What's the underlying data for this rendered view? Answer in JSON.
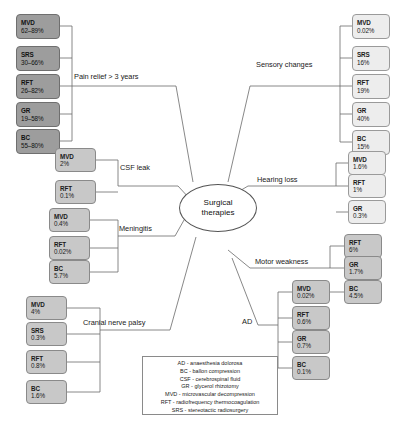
{
  "diagram": {
    "center": {
      "line1": "Surgical",
      "line2": "therapies"
    },
    "branches": [
      {
        "id": "pain-relief",
        "label": "Pain relief > 3 years",
        "side": "left",
        "shade": "dark",
        "nodes": [
          {
            "code": "MVD",
            "value": "62–89%"
          },
          {
            "code": "SRS",
            "value": "30–66%"
          },
          {
            "code": "RFT",
            "value": "26–82%"
          },
          {
            "code": "GR",
            "value": "19–58%"
          },
          {
            "code": "BC",
            "value": "55–80%"
          }
        ]
      },
      {
        "id": "csf-leak",
        "label": "CSF leak",
        "side": "left",
        "shade": "mid",
        "nodes": [
          {
            "code": "MVD",
            "value": "2%"
          },
          {
            "code": "RFT",
            "value": "0.1%"
          }
        ]
      },
      {
        "id": "meningitis",
        "label": "Meningitis",
        "side": "left",
        "shade": "mid",
        "nodes": [
          {
            "code": "MVD",
            "value": "0.4%"
          },
          {
            "code": "RFT",
            "value": "0.02%"
          },
          {
            "code": "BC",
            "value": "5.7%"
          }
        ]
      },
      {
        "id": "cranial-nerve-palsy",
        "label": "Cranial nerve palsy",
        "side": "left",
        "shade": "mid",
        "nodes": [
          {
            "code": "MVD",
            "value": "4%"
          },
          {
            "code": "SRS",
            "value": "0.3%"
          },
          {
            "code": "RFT",
            "value": "0.8%"
          },
          {
            "code": "BC",
            "value": "1.6%"
          }
        ]
      },
      {
        "id": "sensory-changes",
        "label": "Sensory changes",
        "side": "right",
        "shade": "light",
        "nodes": [
          {
            "code": "MVD",
            "value": "0.02%"
          },
          {
            "code": "SRS",
            "value": "16%"
          },
          {
            "code": "RFT",
            "value": "19%"
          },
          {
            "code": "GR",
            "value": "40%"
          },
          {
            "code": "BC",
            "value": "15%"
          }
        ]
      },
      {
        "id": "hearing-loss",
        "label": "Hearing loss",
        "side": "right",
        "shade": "light",
        "nodes": [
          {
            "code": "MVD",
            "value": "1.6%"
          },
          {
            "code": "RFT",
            "value": "1%"
          },
          {
            "code": "GR",
            "value": "0.3%"
          }
        ]
      },
      {
        "id": "motor-weakness",
        "label": "Motor weakness",
        "side": "right",
        "shade": "mid",
        "nodes": [
          {
            "code": "RFT",
            "value": "6%"
          },
          {
            "code": "GR",
            "value": "1.7%"
          },
          {
            "code": "BC",
            "value": "4.5%"
          }
        ]
      },
      {
        "id": "ad",
        "label": "AD",
        "side": "right",
        "shade": "mid",
        "nodes": [
          {
            "code": "MVD",
            "value": "0.02%"
          },
          {
            "code": "RFT",
            "value": "0.6%"
          },
          {
            "code": "GR",
            "value": "0.7%"
          },
          {
            "code": "BC",
            "value": "0.1%"
          }
        ]
      }
    ],
    "legend": [
      "AD - anaesthesia dolorosa",
      "BC - ballon compression",
      "CSF - cerebrospinal fluid",
      "GR - glycerol rhizotomy",
      "MVD - microvascular decompression",
      "RFT - radiofrequency thermocoagulation",
      "SRS - stereotactic radiosurgery"
    ],
    "colors": {
      "node_dark": "#9d9d9d",
      "node_mid": "#c8c8c8",
      "node_light": "#ededed",
      "edge": "#6a6a6a",
      "text": "#1a1a1a",
      "background": "#ffffff"
    }
  }
}
